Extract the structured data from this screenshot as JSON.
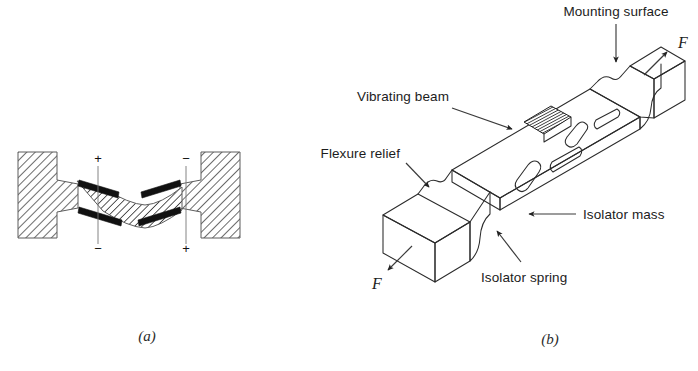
{
  "figure": {
    "type": "technical-line-diagram",
    "background_color": "#ffffff",
    "line_color": "#2b2b2b",
    "text_color": "#1c1c1c"
  },
  "panel_a": {
    "caption": "(a)",
    "description": "Double-ended tuning fork beam clamped between two hatched walls, shown in flexed state",
    "polarity_labels": {
      "left_top": "+",
      "left_bottom": "−",
      "right_top": "−",
      "right_bottom": "+"
    }
  },
  "panel_b": {
    "caption": "(b)",
    "description": "Isometric view of a force sensor showing the vibrating beam, isolator masses and springs",
    "labels": [
      {
        "id": "mounting-surface",
        "text": "Mounting surface"
      },
      {
        "id": "vibrating-beam",
        "text": "Vibrating beam"
      },
      {
        "id": "flexure-relief",
        "text": "Flexure relief"
      },
      {
        "id": "isolator-mass",
        "text": "Isolator mass"
      },
      {
        "id": "isolator-spring",
        "text": "Isolator spring"
      }
    ],
    "force_labels": [
      {
        "id": "force-upper-right",
        "text": "F"
      },
      {
        "id": "force-lower-left",
        "text": "F"
      }
    ]
  }
}
